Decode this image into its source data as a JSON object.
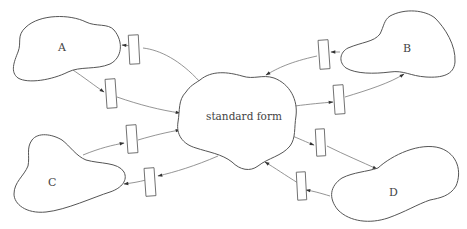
{
  "diagram": {
    "title": "",
    "center": {
      "label": "standard form"
    },
    "nodes": [
      {
        "id": "A",
        "label": "A"
      },
      {
        "id": "B",
        "label": "B"
      },
      {
        "id": "C",
        "label": "C"
      },
      {
        "id": "D",
        "label": "D"
      }
    ],
    "edges": [
      {
        "from": "standard form",
        "to": "A",
        "has_box": true
      },
      {
        "from": "A",
        "to": "standard form",
        "has_box": true
      },
      {
        "from": "B",
        "to": "standard form",
        "has_box": true
      },
      {
        "from": "standard form",
        "to": "B",
        "has_box": true
      },
      {
        "from": "C",
        "to": "standard form",
        "has_box": true
      },
      {
        "from": "standard form",
        "to": "C",
        "has_box": true
      },
      {
        "from": "standard form",
        "to": "D",
        "has_box": true
      },
      {
        "from": "D",
        "to": "standard form",
        "has_box": true
      }
    ],
    "colors": {
      "outline": "#555555",
      "edge": "#7a7a7a",
      "text": "#444444",
      "background": "#ffffff"
    }
  }
}
